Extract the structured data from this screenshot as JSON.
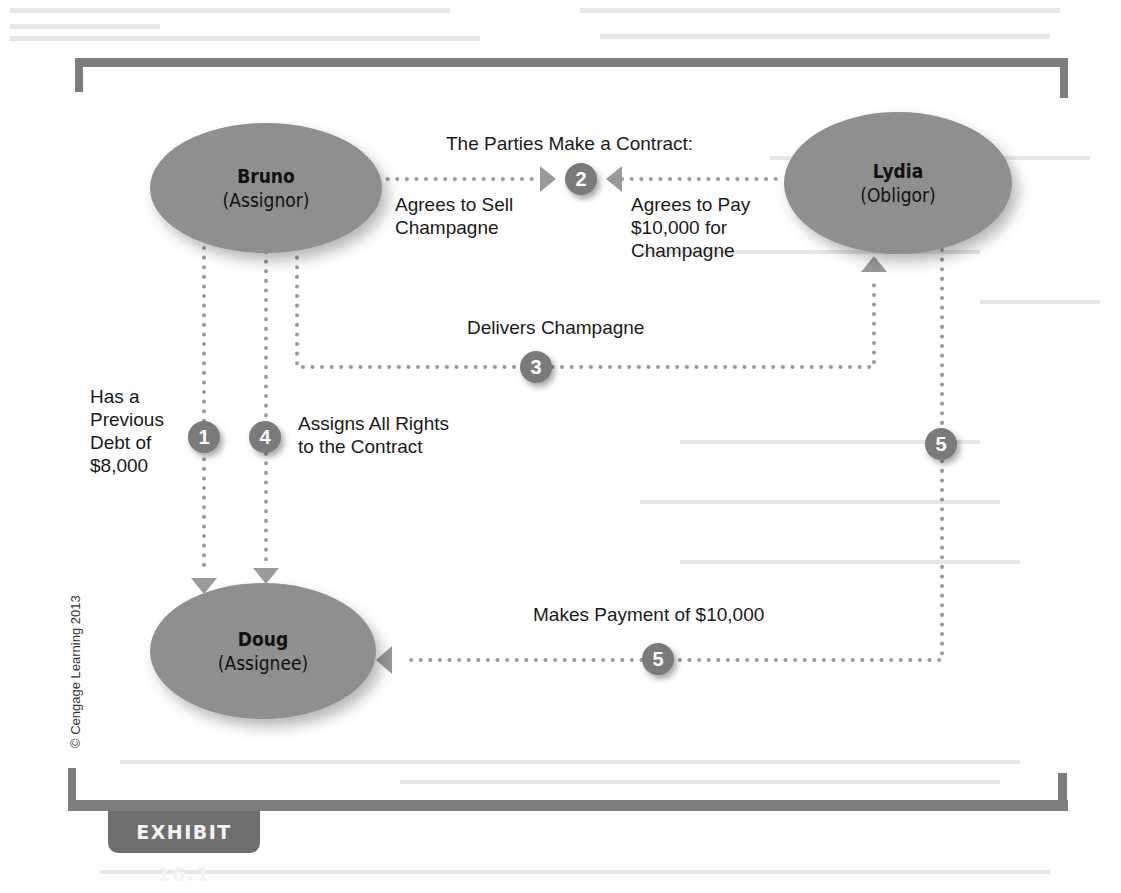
{
  "exhibit": {
    "label": "EXHIBIT 16.1",
    "copyright": "© Cengage Learning 2013"
  },
  "colors": {
    "frame": "#7d7d7d",
    "ellipse": "#8f8f8f",
    "badge": "#7a7a7a",
    "connector": "#9a9a9a",
    "tab": "#6e6e6e"
  },
  "parties": {
    "bruno": {
      "name": "Bruno",
      "role": "(Assignor)"
    },
    "lydia": {
      "name": "Lydia",
      "role": "(Obligor)"
    },
    "doug": {
      "name": "Doug",
      "role": "(Assignee)"
    }
  },
  "steps": {
    "contract_title": "The Parties Make a Contract:",
    "step1": {
      "number": "1",
      "label": "Has a\nPrevious\nDebt of\n$8,000"
    },
    "step2": {
      "number": "2",
      "left_label": "Agrees to Sell\nChampagne",
      "right_label": "Agrees to Pay\n$10,000 for\nChampagne"
    },
    "step3": {
      "number": "3",
      "label": "Delivers Champagne"
    },
    "step4": {
      "number": "4",
      "label": "Assigns All Rights\nto the Contract"
    },
    "step5": {
      "number": "5",
      "label": "Makes Payment of $10,000"
    },
    "step5_vertical": {
      "number": "5"
    }
  }
}
